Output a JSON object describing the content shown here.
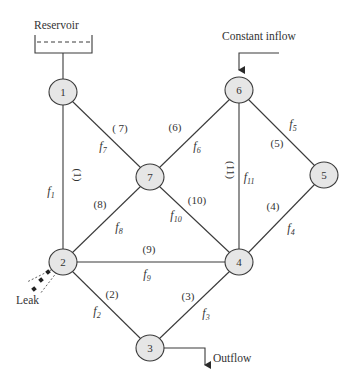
{
  "annotations": {
    "reservoir": "Reservoir",
    "inflow": "Constant inflow",
    "outflow": "Outflow",
    "leak": "Leak"
  },
  "nodes": [
    {
      "id": "1",
      "x": 63,
      "y": 92
    },
    {
      "id": "2",
      "x": 63,
      "y": 262
    },
    {
      "id": "3",
      "x": 150,
      "y": 348
    },
    {
      "id": "4",
      "x": 239,
      "y": 262
    },
    {
      "id": "5",
      "x": 324,
      "y": 175
    },
    {
      "id": "6",
      "x": 239,
      "y": 90
    },
    {
      "id": "7",
      "x": 150,
      "y": 177
    }
  ],
  "pipes": [
    {
      "id": "(1)",
      "flow": "f",
      "sub": "1",
      "from": "1",
      "to": "2"
    },
    {
      "id": "(2)",
      "flow": "f",
      "sub": "2",
      "from": "2",
      "to": "3"
    },
    {
      "id": "(3)",
      "flow": "f",
      "sub": "3",
      "from": "3",
      "to": "4"
    },
    {
      "id": "(4)",
      "flow": "f",
      "sub": "4",
      "from": "4",
      "to": "5"
    },
    {
      "id": "(5)",
      "flow": "f",
      "sub": "5",
      "from": "5",
      "to": "6"
    },
    {
      "id": "(6)",
      "flow": "f",
      "sub": "6",
      "from": "6",
      "to": "7"
    },
    {
      "id": "( 7)",
      "flow": "f",
      "sub": "7",
      "from": "1",
      "to": "7"
    },
    {
      "id": "(8)",
      "flow": "f",
      "sub": "8",
      "from": "2",
      "to": "7"
    },
    {
      "id": "(9)",
      "flow": "f",
      "sub": "9",
      "from": "2",
      "to": "4"
    },
    {
      "id": "(10)",
      "flow": "f",
      "sub": "10",
      "from": "7",
      "to": "4"
    },
    {
      "id": "(11)",
      "flow": "f",
      "sub": "11",
      "from": "6",
      "to": "4"
    }
  ]
}
